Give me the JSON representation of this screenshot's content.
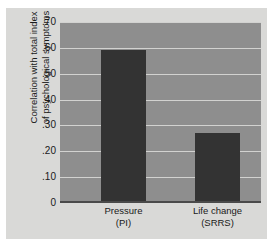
{
  "chart_data": {
    "type": "bar",
    "title": "",
    "xlabel": "",
    "ylabel": "Correlation with total index of psychological symptoms",
    "ylabel_line1": "Correlation with total index",
    "ylabel_line2": "of psychological symptoms",
    "categories": [
      "Pressure (PI)",
      "Life change (SRRS)"
    ],
    "category_labels": [
      {
        "line1": "Pressure",
        "line2": "(PI)"
      },
      {
        "line1": "Life change",
        "line2": "(SRRS)"
      }
    ],
    "values": [
      0.59,
      0.27
    ],
    "ylim": [
      0,
      0.7
    ],
    "yticks": [
      0.7,
      0.6,
      0.5,
      0.4,
      0.3,
      0.2,
      0.1,
      0
    ],
    "ytick_labels": [
      ".70",
      ".60",
      ".50",
      ".40",
      ".30",
      ".20",
      ".10",
      "0"
    ],
    "grid": true,
    "legend": "none",
    "colors": {
      "bar": "#333333",
      "plot_background": "#8e8e8e",
      "figure_background": "#d9d9d7",
      "gridline": "#d2d2d0",
      "axis": "#4a4a4a",
      "text": "#1a1a1a"
    }
  }
}
